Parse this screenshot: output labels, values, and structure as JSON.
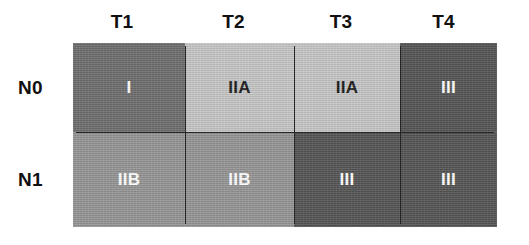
{
  "figure": {
    "title": "",
    "type": "staging-matrix",
    "column_axis_label": "",
    "row_axis_label": ""
  },
  "columns": [
    {
      "label": "T1"
    },
    {
      "label": "T2"
    },
    {
      "label": "T3"
    },
    {
      "label": "T4"
    }
  ],
  "rows": [
    {
      "label": "N0"
    },
    {
      "label": "N1"
    }
  ],
  "colors": {
    "stage_I": "#6e6e6e",
    "stage_IIA": "#c6c6c6",
    "stage_IIB": "#959595",
    "stage_III": "#555555",
    "border": "#0d0d0d",
    "gridline": "#262626",
    "text_dark": "#101010",
    "text_light": "#ffffff",
    "background": "#ffffff"
  },
  "chart_data": {
    "type": "heatmap",
    "title": "",
    "xlabel": "",
    "ylabel": "",
    "categories_x": [
      "T1",
      "T2",
      "T3",
      "T4"
    ],
    "categories_y": [
      "N0",
      "N1"
    ],
    "legend": [
      {
        "stage": "I",
        "color": "#6e6e6e"
      },
      {
        "stage": "IIA",
        "color": "#c6c6c6"
      },
      {
        "stage": "IIB",
        "color": "#959595"
      },
      {
        "stage": "III",
        "color": "#555555"
      }
    ],
    "cells": [
      {
        "row": "N0",
        "col": "T1",
        "value": "I",
        "color": "#6e6e6e",
        "text_color": "#ffffff"
      },
      {
        "row": "N0",
        "col": "T2",
        "value": "IIA",
        "color": "#c6c6c6",
        "text_color": "#1a1a1a"
      },
      {
        "row": "N0",
        "col": "T3",
        "value": "IIA",
        "color": "#c6c6c6",
        "text_color": "#1a1a1a"
      },
      {
        "row": "N0",
        "col": "T4",
        "value": "III",
        "color": "#555555",
        "text_color": "#ffffff"
      },
      {
        "row": "N1",
        "col": "T1",
        "value": "IIB",
        "color": "#959595",
        "text_color": "#ffffff"
      },
      {
        "row": "N1",
        "col": "T2",
        "value": "IIB",
        "color": "#959595",
        "text_color": "#ffffff"
      },
      {
        "row": "N1",
        "col": "T3",
        "value": "III",
        "color": "#555555",
        "text_color": "#ffffff"
      },
      {
        "row": "N1",
        "col": "T4",
        "value": "III",
        "color": "#555555",
        "text_color": "#ffffff"
      }
    ]
  }
}
